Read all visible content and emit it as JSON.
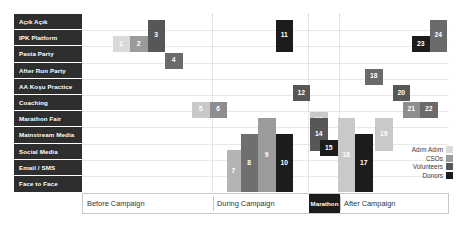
{
  "chart_data": {
    "type": "heatmap",
    "title": "",
    "xlabel": "",
    "ylabel": "",
    "grid": true,
    "legend_position": "bottom-right",
    "categories_y": [
      "Açık Açık",
      "IPK Platform",
      "Pasta Party",
      "After Run Party",
      "AA Koşu Practice",
      "Coaching",
      "Marathon Fair",
      "Mainstream Media",
      "Social Media",
      "Email / SMS",
      "Face to Face"
    ],
    "categories_x": [
      "Before Campaign",
      "During Campaign",
      "Marathon",
      "After Campaign"
    ],
    "series": [
      {
        "name": "Adım Adım",
        "color": "#d9dada"
      },
      {
        "name": "CSOs",
        "color": "#9b9b9b"
      },
      {
        "name": "Volunteers",
        "color": "#575757"
      },
      {
        "name": "Donors",
        "color": "#1c1c1c"
      }
    ],
    "points": [
      {
        "label": "1",
        "group": "Adım Adım",
        "color": "#d9dada",
        "x": 30.5,
        "y": 22.0,
        "w": 17.5,
        "h": 16.2
      },
      {
        "label": "2",
        "group": "CSOs",
        "color": "#9b9b9b",
        "x": 48.0,
        "y": 22.0,
        "w": 17.5,
        "h": 16.2
      },
      {
        "label": "3",
        "group": "Volunteers",
        "color": "#575757",
        "x": 65.5,
        "y": 5.5,
        "w": 17.5,
        "h": 32.5
      },
      {
        "label": "4",
        "group": "Volunteers",
        "color": "#6a6a6a",
        "x": 83.0,
        "y": 38.5,
        "w": 17.5,
        "h": 16.2
      },
      {
        "label": "5",
        "group": "Adım Adım",
        "color": "#c9c9c9",
        "x": 110.0,
        "y": 87.5,
        "w": 17.5,
        "h": 16.2
      },
      {
        "label": "6",
        "group": "CSOs",
        "color": "#8e8e8e",
        "x": 127.5,
        "y": 87.5,
        "w": 17.5,
        "h": 16.2
      },
      {
        "label": "7",
        "group": "Adım Adım",
        "color": "#b4b4b4",
        "x": 144.5,
        "y": 136.0,
        "w": 14.0,
        "h": 42.0
      },
      {
        "label": "8",
        "group": "CSOs",
        "color": "#6f6f6f",
        "x": 158.5,
        "y": 120.0,
        "w": 17.5,
        "h": 58.0
      },
      {
        "label": "9",
        "group": "CSOs",
        "color": "#9b9b9b",
        "x": 176.0,
        "y": 104.0,
        "w": 17.5,
        "h": 74.0
      },
      {
        "label": "10",
        "group": "Donors",
        "color": "#1c1c1c",
        "x": 193.5,
        "y": 120.0,
        "w": 17.5,
        "h": 58.0
      },
      {
        "label": "11",
        "group": "Donors",
        "color": "#1c1c1c",
        "x": 193.5,
        "y": 5.5,
        "w": 17.5,
        "h": 32.5
      },
      {
        "label": "12",
        "group": "Volunteers",
        "color": "#575757",
        "x": 210.5,
        "y": 71.0,
        "w": 17.5,
        "h": 16.2
      },
      {
        "label": "13",
        "group": "Adım Adım",
        "color": "#c9c9c9",
        "x": 228.0,
        "y": 98.0,
        "w": 17.5,
        "h": 16.2
      },
      {
        "label": "14",
        "group": "Volunteers",
        "color": "#575757",
        "x": 228.0,
        "y": 104.0,
        "w": 17.5,
        "h": 32.5
      },
      {
        "label": "15",
        "group": "Donors",
        "color": "#1c1c1c",
        "x": 238.0,
        "y": 126.0,
        "w": 17.5,
        "h": 16.2
      },
      {
        "label": "16",
        "group": "Adım Adım",
        "color": "#c9c9c9",
        "x": 255.5,
        "y": 104.0,
        "w": 17.5,
        "h": 74.0
      },
      {
        "label": "17",
        "group": "Donors",
        "color": "#1c1c1c",
        "x": 273.0,
        "y": 120.0,
        "w": 17.5,
        "h": 58.0
      },
      {
        "label": "18",
        "group": "Volunteers",
        "color": "#6a6a6a",
        "x": 283.0,
        "y": 54.5,
        "w": 17.5,
        "h": 16.2
      },
      {
        "label": "19",
        "group": "Adım Adım",
        "color": "#c9c9c9",
        "x": 293.0,
        "y": 104.0,
        "w": 17.5,
        "h": 32.5
      },
      {
        "label": "20",
        "group": "Volunteers",
        "color": "#575757",
        "x": 310.5,
        "y": 71.0,
        "w": 17.5,
        "h": 16.2
      },
      {
        "label": "21",
        "group": "CSOs",
        "color": "#8e8e8e",
        "x": 320.5,
        "y": 87.5,
        "w": 17.5,
        "h": 16.2
      },
      {
        "label": "22",
        "group": "Volunteers",
        "color": "#6a6a6a",
        "x": 338.0,
        "y": 87.5,
        "w": 17.5,
        "h": 16.2
      },
      {
        "label": "23",
        "group": "Donors",
        "color": "#1c1c1c",
        "x": 330.0,
        "y": 22.0,
        "w": 17.5,
        "h": 16.2
      },
      {
        "label": "24",
        "group": "Volunteers",
        "color": "#6a6a6a",
        "x": 347.5,
        "y": 5.5,
        "w": 17.5,
        "h": 32.5
      }
    ],
    "x_sections": [
      {
        "label": "Before Campaign",
        "left": 0,
        "width": 130
      },
      {
        "label": "During Campaign",
        "left": 130,
        "width": 96
      },
      {
        "label": "Marathon",
        "left": 226,
        "width": 31
      },
      {
        "label": "After Campaign",
        "left": 257,
        "width": 110
      }
    ],
    "gridline_rows": 11
  }
}
